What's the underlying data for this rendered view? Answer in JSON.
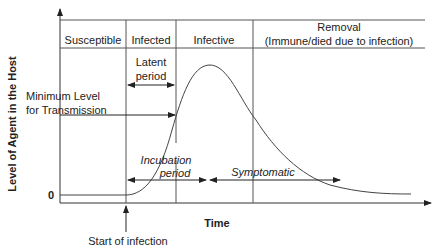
{
  "diagram": {
    "stages": [
      "Susceptible",
      "Infected",
      "Infective",
      "Removal",
      "(Immune/died due to infection)"
    ],
    "latent_period": [
      "Latent",
      "period"
    ],
    "min_level": [
      "Minimum Level",
      "for Transmission"
    ],
    "incubation_period": [
      "Incubation",
      "period"
    ],
    "symptomatic": "Symptomatic",
    "y_axis_label": "Level of Agent in the Host",
    "x_axis_label": "Time",
    "zero_label": "0",
    "start_label": "Start of infection"
  }
}
